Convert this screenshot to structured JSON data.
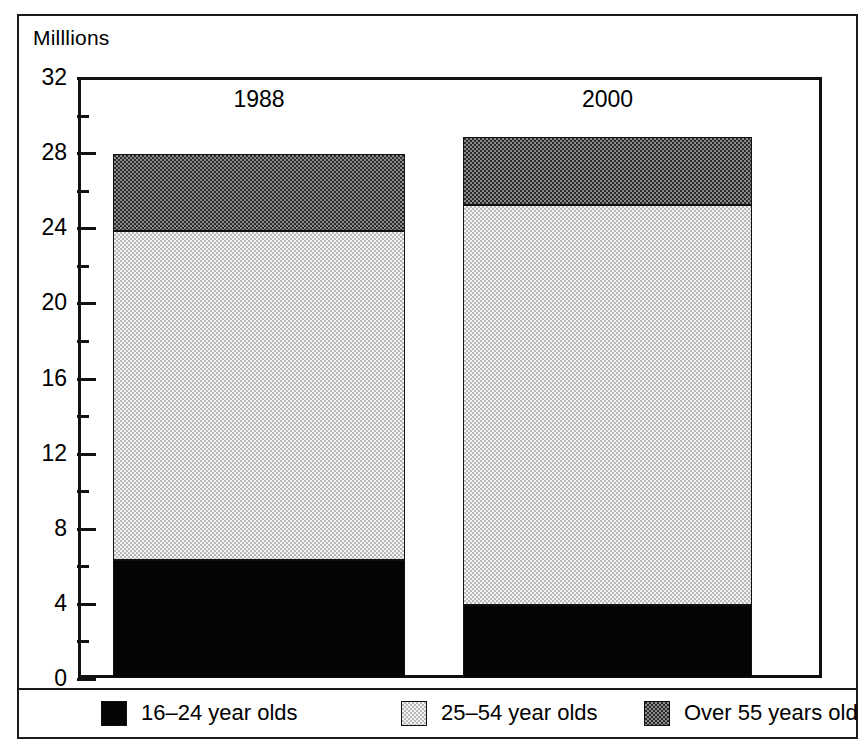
{
  "chart_data": {
    "type": "bar",
    "subtype": "stacked-vertical",
    "title": "",
    "xlabel": "",
    "ylabel": "Milllions",
    "ylim": [
      0,
      32
    ],
    "ytick_step": 4,
    "yminor_step": 2,
    "grid": false,
    "legend_position": "bottom",
    "categories": [
      "1988",
      "2000"
    ],
    "ytick_labels": [
      "0",
      "4",
      "8",
      "12",
      "16",
      "20",
      "24",
      "28",
      "32"
    ],
    "series": [
      {
        "name": "16–24 year olds",
        "values": [
          6.3,
          3.9
        ],
        "fill": "solid-black"
      },
      {
        "name": "25–54 year olds",
        "values": [
          17.5,
          21.3
        ],
        "fill": "light-halftone"
      },
      {
        "name": "Over 55 years old",
        "values": [
          4.1,
          3.6
        ],
        "fill": "dark-halftone"
      }
    ],
    "segment_tops": {
      "1988": {
        "16-24": 6.3,
        "25-54": 23.8,
        "over-55": 27.9
      },
      "2000": {
        "16-24": 3.9,
        "25-54": 25.2,
        "over-55": 28.8
      }
    },
    "totals": [
      27.9,
      28.8
    ]
  },
  "axis": {
    "title": "Milllions",
    "ticks": [
      {
        "value": 32,
        "label": "32",
        "major": true
      },
      {
        "value": 30,
        "label": "",
        "major": false
      },
      {
        "value": 28,
        "label": "28",
        "major": true
      },
      {
        "value": 26,
        "label": "",
        "major": false
      },
      {
        "value": 24,
        "label": "24",
        "major": true
      },
      {
        "value": 22,
        "label": "",
        "major": false
      },
      {
        "value": 20,
        "label": "20",
        "major": true
      },
      {
        "value": 18,
        "label": "",
        "major": false
      },
      {
        "value": 16,
        "label": "16",
        "major": true
      },
      {
        "value": 14,
        "label": "",
        "major": false
      },
      {
        "value": 12,
        "label": "12",
        "major": true
      },
      {
        "value": 10,
        "label": "",
        "major": false
      },
      {
        "value": 8,
        "label": "8",
        "major": true
      },
      {
        "value": 6,
        "label": "",
        "major": false
      },
      {
        "value": 4,
        "label": "4",
        "major": true
      },
      {
        "value": 2,
        "label": "",
        "major": false
      },
      {
        "value": 0,
        "label": "0",
        "major": true
      }
    ]
  },
  "bars": [
    {
      "label": "1988",
      "segments": [
        {
          "key": "over-55",
          "bottom": 23.8,
          "top": 27.9,
          "fill": "fill-dark"
        },
        {
          "key": "25-54",
          "bottom": 6.3,
          "top": 23.8,
          "fill": "fill-light"
        },
        {
          "key": "16-24",
          "bottom": 0.0,
          "top": 6.3,
          "fill": "fill-black"
        }
      ]
    },
    {
      "label": "2000",
      "segments": [
        {
          "key": "over-55",
          "bottom": 25.2,
          "top": 28.8,
          "fill": "fill-dark"
        },
        {
          "key": "25-54",
          "bottom": 3.9,
          "top": 25.2,
          "fill": "fill-light"
        },
        {
          "key": "16-24",
          "bottom": 0.0,
          "top": 3.9,
          "fill": "fill-black"
        }
      ]
    }
  ],
  "legend": {
    "items": [
      {
        "label": "16–24 year olds",
        "fill": "fill-black",
        "left": 82
      },
      {
        "label": "25–54 year olds",
        "fill": "fill-light",
        "left": 382
      },
      {
        "label": "Over 55 years old",
        "fill": "fill-dark",
        "left": 625
      }
    ]
  },
  "colors": {
    "ink": "#111111",
    "frame": "#1a1a1a",
    "black_fill": "#050505",
    "light_fill": "#dcdcdc",
    "dark_fill": "#3f3f3f",
    "paper": "#ffffff"
  }
}
